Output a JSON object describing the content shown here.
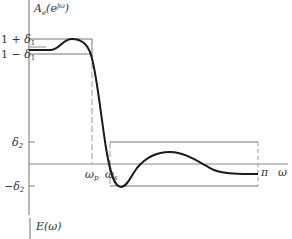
{
  "diagram": {
    "type": "filter-specification",
    "upper_panel": {
      "y_axis_label": "A_e(e^{jω})",
      "y_axis_label_main": "A",
      "y_axis_label_sub": "e",
      "y_axis_label_arg": "(e",
      "y_axis_label_sup": "jω",
      "y_axis_label_close": ")",
      "x_axis_label": "ω",
      "tick_labels": {
        "one_plus_delta1": "1 + δ",
        "one_plus_delta1_sub": "1",
        "one_minus_delta1": "1 − δ",
        "one_minus_delta1_sub": "1",
        "delta2": "δ",
        "delta2_sub": "2",
        "minus_delta2": "−δ",
        "minus_delta2_sub": "2",
        "omega_p": "ω",
        "omega_p_sub": "p",
        "omega_s": "ω",
        "omega_s_sub": "s",
        "pi": "π"
      }
    },
    "lower_panel": {
      "y_axis_label": "E(ω)"
    },
    "colors": {
      "curve": "#1a1a1a",
      "axes": "#888888",
      "bounds": "#777777",
      "dashed": "#999999",
      "text": "#333333"
    }
  }
}
